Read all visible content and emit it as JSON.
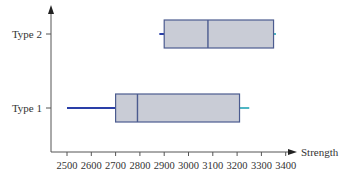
{
  "chart_data": {
    "type": "boxplot",
    "title": "",
    "xlabel": "Strength",
    "ylabel": "",
    "xlim": [
      2450,
      3450
    ],
    "xticks": [
      2500,
      2600,
      2700,
      2800,
      2900,
      3000,
      3100,
      3200,
      3300,
      3400
    ],
    "xtick_labels": [
      "2500",
      "2600",
      "2700",
      "2800",
      "2900",
      "3000",
      "3100",
      "3200",
      "3300",
      "3400"
    ],
    "categories": [
      "Type 1",
      "Type 2"
    ],
    "series": [
      {
        "name": "Type 1",
        "whisker_low": 2500,
        "q1": 2700,
        "median": 2790,
        "q3": 3210,
        "whisker_high": 3250
      },
      {
        "name": "Type 2",
        "whisker_low": 2880,
        "q1": 2900,
        "median": 3080,
        "q3": 3350,
        "whisker_high": 3360
      }
    ],
    "grid": false,
    "legend": "none",
    "colors": {
      "box_fill": "#c9ccd6",
      "box_stroke": "#4b5b8f",
      "whisker_left": "#2a3fa8",
      "whisker_right": "#4fb6c4",
      "axis": "#555555"
    }
  }
}
